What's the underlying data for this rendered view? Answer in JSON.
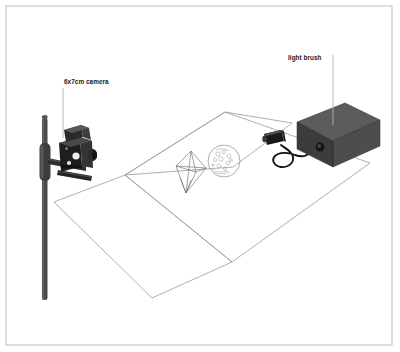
{
  "figure": {
    "kind": "technical-illustration",
    "background_color": "#ffffff",
    "frame": {
      "name": "image-border",
      "color": "#c9c9c9",
      "x": 6,
      "y": 6,
      "width": 386,
      "height": 339
    }
  },
  "labels": [
    {
      "id": "camera",
      "text": "6x7cm camera",
      "x": 64,
      "y": 84,
      "anchor": "start",
      "leader": {
        "x1": 63,
        "y1": 88,
        "x2": 63,
        "y2": 138,
        "color": "#b0b0b0"
      }
    },
    {
      "id": "light_brush",
      "text": "light brush",
      "x": 288,
      "y": 60,
      "anchor": "start",
      "leader": {
        "x1": 333,
        "y1": 55,
        "x2": 333,
        "y2": 125,
        "color": "#b0b0b0"
      }
    }
  ],
  "scene": {
    "table_upper": {
      "name": "table-surface-upper",
      "points": "125,175 225,112 292,123 233,167",
      "stroke": "#9a9a9a",
      "fill": "none"
    },
    "table_plane_main": {
      "name": "table-surface-main",
      "points": "125,175 225,112 370,163 232,262",
      "stroke": "#9a9a9a",
      "fill": "none"
    },
    "table_plane_lower": {
      "name": "table-surface-lower",
      "points": "54,202 125,175 232,262 152,298",
      "stroke": "#9a9a9a",
      "fill": "none"
    },
    "colors": {
      "line": "#9a9a9a",
      "camera_dark": "#1c1c1c",
      "camera_mid": "#3a3a3a",
      "camera_light": "#5e5e5e",
      "tripod": "#4a4a4a",
      "box_top": "#595959",
      "box_front": "#3f3f3f",
      "box_side": "#4f4f4f",
      "cable": "#121212",
      "wand": "#1a1a1a",
      "object_line": "#7a7a7a"
    },
    "objects": [
      {
        "id": "crystal",
        "name": "wireframe-crystal-object",
        "cx": 192,
        "cy": 172
      },
      {
        "id": "disc",
        "name": "textured-disc-object",
        "cx": 224,
        "cy": 161,
        "r": 16
      }
    ],
    "devices": [
      {
        "id": "camera_body",
        "name": "medium-format-camera"
      },
      {
        "id": "tripod_column",
        "name": "tripod-column"
      },
      {
        "id": "light_brush_box",
        "name": "light-brush-power-unit"
      },
      {
        "id": "light_wand",
        "name": "light-brush-wand"
      },
      {
        "id": "wand_cable",
        "name": "wand-cable"
      }
    ]
  }
}
